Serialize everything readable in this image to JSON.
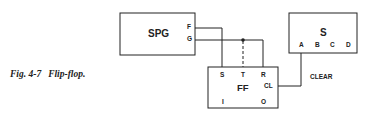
{
  "caption": {
    "figure_number": "Fig. 4-7",
    "title": "Flip-flop."
  },
  "blocks": {
    "spg": {
      "label": "SPG",
      "outputs": [
        "F",
        "G"
      ]
    },
    "ff": {
      "label": "FF",
      "inputs_top": [
        "S",
        "T",
        "R"
      ],
      "right_pin": "CL",
      "outputs_bottom": [
        "I",
        "O"
      ]
    },
    "s": {
      "label": "S",
      "pins": [
        "A",
        "B",
        "C",
        "D"
      ]
    }
  },
  "connections": {
    "clear_label": "CLEAR"
  },
  "colors": {
    "line": "#222222",
    "background": "#ffffff"
  }
}
